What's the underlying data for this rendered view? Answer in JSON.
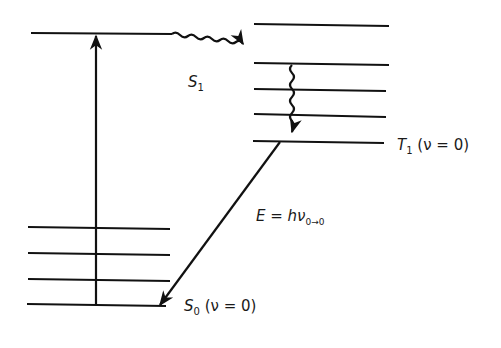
{
  "diagram": {
    "title": "",
    "type": "jablonski-energy-level-diagram",
    "colors": {
      "line": "#111111",
      "background": "#ffffff"
    },
    "labels": {
      "s1": {
        "symbol": "S",
        "subscript": "1"
      },
      "t1": {
        "symbol": "T",
        "subscript": "1",
        "suffix": "(ν = 0)"
      },
      "s0": {
        "symbol": "S",
        "subscript": "0",
        "suffix": "(ν = 0)"
      },
      "energy": {
        "lhs": "E",
        "eq": " = ",
        "h": "h",
        "nu": "ν",
        "subscript": "0→0"
      }
    },
    "levels": {
      "s1": [
        {
          "y": 33,
          "x1": 31,
          "x2": 172
        }
      ],
      "t1": [
        {
          "y": 25,
          "x1": 254,
          "x2": 389
        },
        {
          "y": 64,
          "x1": 254,
          "x2": 389
        },
        {
          "y": 90,
          "x1": 254,
          "x2": 386
        },
        {
          "y": 115,
          "x1": 254,
          "x2": 386
        },
        {
          "y": 141,
          "x1": 253,
          "x2": 384
        }
      ],
      "s0": [
        {
          "y": 228,
          "x1": 28,
          "x2": 170
        },
        {
          "y": 254,
          "x1": 28,
          "x2": 170
        },
        {
          "y": 280,
          "x1": 28,
          "x2": 170
        },
        {
          "y": 305,
          "x1": 27,
          "x2": 166
        }
      ]
    },
    "transitions": [
      {
        "name": "absorption",
        "kind": "straight-arrow",
        "from": "S0 v=0",
        "to": "S1"
      },
      {
        "name": "intersystem-crossing",
        "kind": "wavy-arrow",
        "from": "S1",
        "to": "T1 upper vibrational level"
      },
      {
        "name": "vibrational-relaxation",
        "kind": "wavy-arrow",
        "from": "T1 upper level",
        "to": "T1 v=0"
      },
      {
        "name": "phosphorescence",
        "kind": "straight-arrow",
        "from": "T1 v=0",
        "to": "S0 v=0"
      }
    ]
  }
}
